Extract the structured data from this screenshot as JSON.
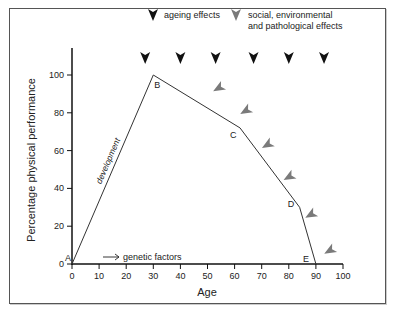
{
  "chart_data": {
    "type": "line",
    "title": "",
    "xlabel": "Age",
    "ylabel": "Percentage physical performance",
    "xlim": [
      0,
      100
    ],
    "ylim": [
      0,
      100
    ],
    "x_ticks": [
      0,
      10,
      20,
      30,
      40,
      50,
      60,
      70,
      80,
      90,
      100
    ],
    "y_ticks": [
      0,
      20,
      40,
      60,
      80,
      100
    ],
    "grid": false,
    "series": [
      {
        "name": "physical performance",
        "points": [
          {
            "label": "A",
            "x": 0,
            "y": 0
          },
          {
            "label": "B",
            "x": 30,
            "y": 100
          },
          {
            "label": "C",
            "x": 62,
            "y": 72
          },
          {
            "label": "D",
            "x": 84,
            "y": 30
          },
          {
            "label": "E",
            "x": 90,
            "y": 0
          }
        ]
      }
    ],
    "annotations": {
      "development": "development",
      "genetic": "genetic factors"
    },
    "legend": {
      "placement": "top",
      "items": [
        {
          "label": "ageing effects",
          "marker": "black-arrowhead",
          "color": "#111111"
        },
        {
          "label": "social, environmental and pathological effects",
          "label_lines": [
            "social, environmental",
            "and pathological effects"
          ],
          "marker": "grey-arrowhead",
          "color": "#777777"
        }
      ]
    },
    "ageing_arrows_x": [
      27,
      40,
      53,
      67,
      80,
      93
    ],
    "social_arrows": [
      {
        "x": 54,
        "y": 93
      },
      {
        "x": 64,
        "y": 81
      },
      {
        "x": 72,
        "y": 63
      },
      {
        "x": 80,
        "y": 46
      },
      {
        "x": 88,
        "y": 26
      },
      {
        "x": 95,
        "y": 7
      }
    ]
  }
}
